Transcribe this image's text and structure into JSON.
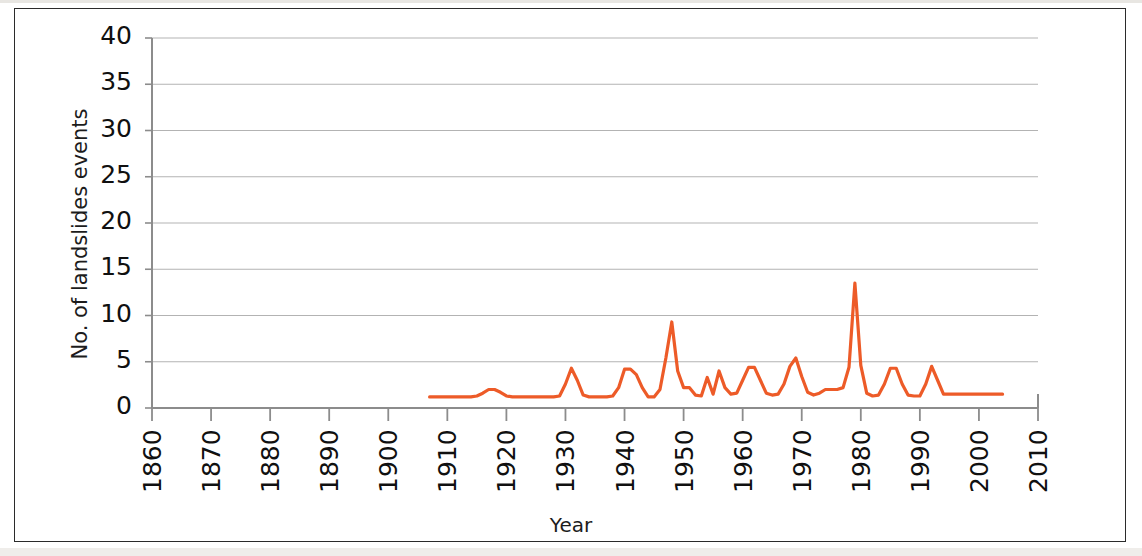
{
  "figure": {
    "background_color": "#ffffff",
    "frame_color": "#2b2b2b"
  },
  "chart_data": {
    "type": "line",
    "title": "",
    "xlabel": "Year",
    "ylabel": "No. of landslides events",
    "xlim": [
      1860,
      2010
    ],
    "ylim": [
      0,
      40
    ],
    "xticks": [
      1860,
      1870,
      1880,
      1890,
      1900,
      1910,
      1920,
      1930,
      1940,
      1950,
      1960,
      1970,
      1980,
      1990,
      2000,
      2010
    ],
    "yticks": [
      0,
      5,
      10,
      15,
      20,
      25,
      30,
      35,
      40
    ],
    "xtick_labels": [
      "1860",
      "1870",
      "1880",
      "1890",
      "1900",
      "1910",
      "1920",
      "1930",
      "1940",
      "1950",
      "1960",
      "1970",
      "1980",
      "1990",
      "2000",
      "2010"
    ],
    "ytick_labels": [
      "0",
      "5",
      "10",
      "15",
      "20",
      "25",
      "30",
      "35",
      "40"
    ],
    "xtick_rotation": 90,
    "grid": "horizontal",
    "grid_color": "#b3b3b3",
    "axis_color": "#8c8c8c",
    "legend": false,
    "series": [
      {
        "name": "No. of landslides events",
        "color": "#ED5B28",
        "line_width": 3.2,
        "x": [
          1907,
          1908,
          1909,
          1910,
          1911,
          1912,
          1913,
          1914,
          1915,
          1916,
          1917,
          1918,
          1919,
          1920,
          1921,
          1922,
          1923,
          1924,
          1925,
          1926,
          1927,
          1928,
          1929,
          1930,
          1931,
          1932,
          1933,
          1934,
          1935,
          1936,
          1937,
          1938,
          1939,
          1940,
          1941,
          1942,
          1943,
          1944,
          1945,
          1946,
          1947,
          1948,
          1949,
          1950,
          1951,
          1952,
          1953,
          1954,
          1955,
          1956,
          1957,
          1958,
          1959,
          1960,
          1961,
          1962,
          1963,
          1964,
          1965,
          1966,
          1967,
          1968,
          1969,
          1970,
          1971,
          1972,
          1973,
          1974,
          1975,
          1976,
          1977,
          1978,
          1979,
          1980,
          1981,
          1982,
          1983,
          1984,
          1985,
          1986,
          1987,
          1988,
          1989,
          1990,
          1991,
          1992,
          1993,
          1994,
          1995,
          1996,
          1997,
          1998,
          1999,
          2000,
          2001,
          2002,
          2003,
          2004
        ],
        "y": [
          1.2,
          1.2,
          1.2,
          1.2,
          1.2,
          1.2,
          1.2,
          1.2,
          1.3,
          1.6,
          2.0,
          2.0,
          1.7,
          1.3,
          1.2,
          1.2,
          1.2,
          1.2,
          1.2,
          1.2,
          1.2,
          1.2,
          1.3,
          2.6,
          4.3,
          3.0,
          1.4,
          1.2,
          1.2,
          1.2,
          1.2,
          1.3,
          2.2,
          4.2,
          4.2,
          3.6,
          2.2,
          1.2,
          1.2,
          2.0,
          5.4,
          9.3,
          4.0,
          2.2,
          2.2,
          1.4,
          1.3,
          3.3,
          1.5,
          4.0,
          2.2,
          1.5,
          1.6,
          3.0,
          4.4,
          4.4,
          3.0,
          1.6,
          1.4,
          1.5,
          2.6,
          4.5,
          5.4,
          3.4,
          1.7,
          1.4,
          1.6,
          2.0,
          2.0,
          2.0,
          2.2,
          4.4,
          13.5,
          4.6,
          1.6,
          1.3,
          1.4,
          2.6,
          4.3,
          4.3,
          2.6,
          1.4,
          1.3,
          1.3,
          2.6,
          4.5,
          3.0,
          1.5,
          1.5,
          1.5,
          1.5,
          1.5,
          1.5,
          1.5,
          1.5,
          1.5,
          1.5,
          1.5
        ]
      }
    ]
  }
}
